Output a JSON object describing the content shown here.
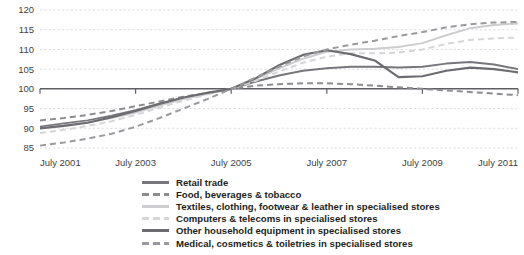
{
  "chart_data": {
    "type": "line",
    "title": "",
    "subtitle": "",
    "xlabel": "",
    "ylabel": "",
    "grid": true,
    "legend_position": "bottom",
    "index_base": "July 2005 = 100",
    "ylim": [
      85,
      120
    ],
    "yticks": [
      85,
      90,
      95,
      100,
      105,
      110,
      115,
      120
    ],
    "ytick_labels": [
      "85",
      "90",
      "95",
      "100",
      "105",
      "110",
      "115",
      "120"
    ],
    "xlim": [
      2001.5,
      2011.5
    ],
    "xticks": [
      2001.5,
      2003.5,
      2005.5,
      2007.5,
      2009.5,
      2011.5
    ],
    "xtick_labels": [
      "July 2001",
      "July 2003",
      "July 2005",
      "July 2007",
      "July 2009",
      "July 2011"
    ],
    "x": [
      2001.5,
      2002.0,
      2002.5,
      2003.0,
      2003.5,
      2004.0,
      2004.5,
      2005.0,
      2005.5,
      2006.0,
      2006.5,
      2007.0,
      2007.5,
      2008.0,
      2008.5,
      2009.0,
      2009.5,
      2010.0,
      2010.5,
      2011.0,
      2011.5
    ],
    "series": [
      {
        "name": "Retail trade",
        "color": "#77777b",
        "style": "solid",
        "width": 2.0,
        "values": [
          90.4,
          91.2,
          92.0,
          93.2,
          94.6,
          96.2,
          97.6,
          98.8,
          100.0,
          101.8,
          103.4,
          104.6,
          105.2,
          105.6,
          105.6,
          105.4,
          105.6,
          106.4,
          106.8,
          106.2,
          105.0
        ]
      },
      {
        "name": "Food, beverages & tobacco",
        "color": "#8d8d91",
        "style": "dashed",
        "width": 2.0,
        "values": [
          92.0,
          92.6,
          93.4,
          94.4,
          95.6,
          96.8,
          98.0,
          99.0,
          100.0,
          100.8,
          101.2,
          101.4,
          101.4,
          101.2,
          100.8,
          100.4,
          100.0,
          99.6,
          99.2,
          98.8,
          98.4
        ]
      },
      {
        "name": "Textiles, clothing, footwear & leather in specialised stores",
        "color": "#cdcdd0",
        "style": "solid",
        "width": 2.0,
        "values": [
          90.0,
          90.8,
          91.6,
          92.6,
          94.0,
          95.8,
          97.4,
          98.8,
          100.0,
          102.4,
          105.2,
          107.6,
          109.4,
          110.0,
          110.2,
          110.6,
          111.6,
          113.6,
          115.4,
          116.2,
          116.6
        ]
      },
      {
        "name": "Computers & telecoms in specialised stores",
        "color": "#d6d6d9",
        "style": "dashed",
        "width": 2.0,
        "values": [
          88.8,
          89.6,
          90.6,
          91.8,
          93.4,
          95.2,
          97.0,
          98.6,
          100.0,
          102.0,
          104.4,
          106.6,
          108.2,
          109.0,
          109.0,
          109.2,
          110.0,
          111.4,
          112.4,
          112.8,
          113.0
        ]
      },
      {
        "name": "Other household equipment in specialised stores",
        "color": "#6b6b70",
        "style": "solid",
        "width": 2.2,
        "values": [
          90.0,
          90.6,
          91.4,
          92.8,
          94.4,
          96.2,
          97.8,
          99.0,
          100.0,
          102.6,
          106.0,
          108.6,
          109.8,
          108.8,
          107.2,
          103.0,
          103.2,
          104.6,
          105.4,
          105.0,
          104.2
        ]
      },
      {
        "name": "Medical, cosmetics & toiletries in specialised stores",
        "color": "#9a9a9e",
        "style": "dashed",
        "width": 2.0,
        "values": [
          85.6,
          86.4,
          87.4,
          88.6,
          90.4,
          92.6,
          95.0,
          97.4,
          100.0,
          102.8,
          105.6,
          108.2,
          110.0,
          111.2,
          112.2,
          113.4,
          114.4,
          115.6,
          116.4,
          116.8,
          117.0
        ]
      }
    ]
  },
  "legend": {
    "items": [
      {
        "label": "Retail trade"
      },
      {
        "label": "Food, beverages & tobacco"
      },
      {
        "label": "Textiles, clothing, footwear & leather in specialised stores"
      },
      {
        "label": "Computers & telecoms in specialised stores"
      },
      {
        "label": "Other household equipment in specialised stores"
      },
      {
        "label": "Medical, cosmetics & toiletries in specialised stores"
      }
    ]
  }
}
